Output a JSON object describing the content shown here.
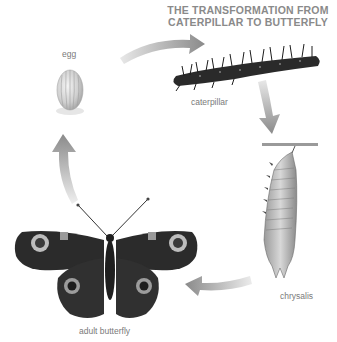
{
  "title": {
    "line1": "THE TRANSFORMATION FROM",
    "line2": "CATERPILLAR TO BUTTERFLY"
  },
  "stages": [
    {
      "id": "egg",
      "label": "egg"
    },
    {
      "id": "caterpillar",
      "label": "caterpillar"
    },
    {
      "id": "chrysalis",
      "label": "chrysalis"
    },
    {
      "id": "adult",
      "label": "adult butterfly"
    }
  ],
  "colors": {
    "arrow": "#8c8c8c",
    "title": "#8a8a8a",
    "label": "#7a7a7a",
    "background": "#ffffff"
  }
}
